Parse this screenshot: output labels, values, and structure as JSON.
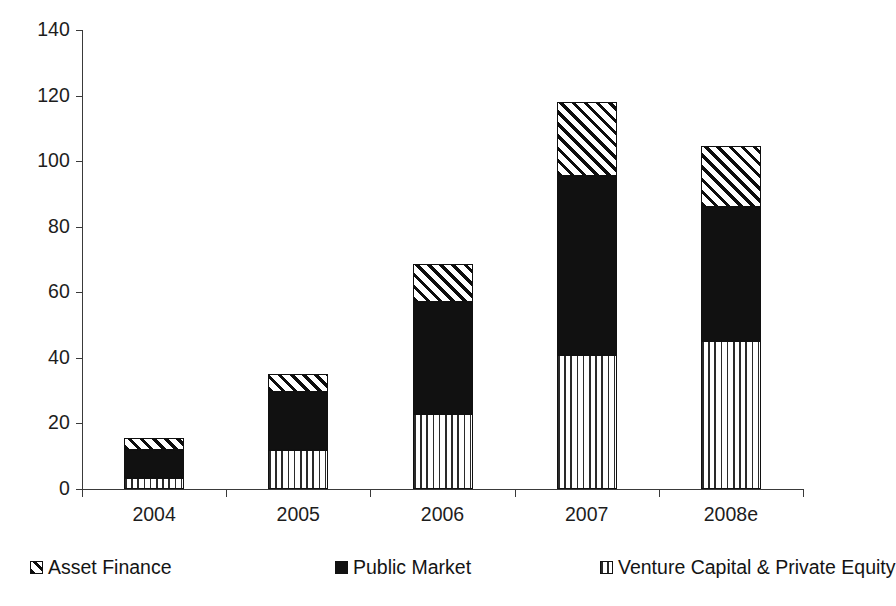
{
  "chart_data": {
    "type": "bar",
    "stacked": true,
    "title": "",
    "subtitle": "",
    "xlabel": "",
    "ylabel": "",
    "categories": [
      "2004",
      "2005",
      "2006",
      "2007",
      "2008e"
    ],
    "ylim": [
      0,
      140
    ],
    "yticks": [
      0,
      20,
      40,
      60,
      80,
      100,
      120,
      140
    ],
    "ytick_labels": [
      "0",
      "20",
      "40",
      "60",
      "80",
      "100",
      "120",
      "140"
    ],
    "grid": false,
    "legend_position": "bottom",
    "series": [
      {
        "name": "Venture Capital & Private Equity",
        "pattern": "vertical-stripes",
        "color": "#ffffff",
        "values": [
          3.5,
          12,
          23,
          41,
          45
        ]
      },
      {
        "name": "Public Market",
        "pattern": "solid-black",
        "color": "#111111",
        "values": [
          8.5,
          17.5,
          34,
          54.5,
          41
        ]
      },
      {
        "name": "Asset Finance",
        "pattern": "diagonal-hatch",
        "color": "#ffffff",
        "values": [
          3.5,
          5.5,
          11.5,
          22.5,
          18.5
        ]
      }
    ],
    "totals": [
      15.5,
      35,
      68.5,
      118,
      104.5
    ],
    "legend_order": [
      "Asset Finance",
      "Public Market",
      "Venture Capital & Private Equity"
    ]
  },
  "axes": {
    "y": {
      "ticks": [
        {
          "label": "140",
          "value": 140
        },
        {
          "label": "120",
          "value": 120
        },
        {
          "label": "100",
          "value": 100
        },
        {
          "label": "80",
          "value": 80
        },
        {
          "label": "60",
          "value": 60
        },
        {
          "label": "40",
          "value": 40
        },
        {
          "label": "20",
          "value": 20
        },
        {
          "label": "0",
          "value": 0
        }
      ]
    },
    "x": {
      "ticks": [
        {
          "label": "2004"
        },
        {
          "label": "2005"
        },
        {
          "label": "2006"
        },
        {
          "label": "2007"
        },
        {
          "label": "2008e"
        }
      ]
    }
  },
  "legend": {
    "items": [
      {
        "label": "Asset Finance",
        "pattern": "diagonal-hatch"
      },
      {
        "label": "Public Market",
        "pattern": "solid-black"
      },
      {
        "label": "Venture Capital & Private Equity",
        "pattern": "vertical-stripes"
      }
    ]
  },
  "colors": {
    "axis": "#3a3a3a",
    "text": "#1d1d1d",
    "solid_series": "#111111",
    "background": "#ffffff"
  }
}
